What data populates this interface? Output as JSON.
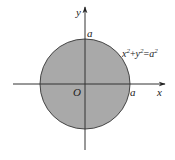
{
  "figure": {
    "colors": {
      "disk_fill": "#a9a9a9",
      "disk_stroke": "#444444",
      "axis": "#333333",
      "background": "#ffffff"
    },
    "circle": {
      "cx": 85,
      "cy": 84,
      "r": 45
    },
    "axes": {
      "x_axis": {
        "x1": 13,
        "x2": 165,
        "y": 84,
        "label": "x"
      },
      "y_axis": {
        "y1": 150,
        "y2": 7,
        "x": 85,
        "label": "y"
      }
    },
    "labels": {
      "origin": "O",
      "x_intercept": "a",
      "y_intercept": "a",
      "equation": {
        "x": "x",
        "x_exp": "2",
        "plus": "+",
        "y": "y",
        "y_exp": "2",
        "eq": "=",
        "a": "a",
        "a_exp": "2"
      }
    }
  }
}
